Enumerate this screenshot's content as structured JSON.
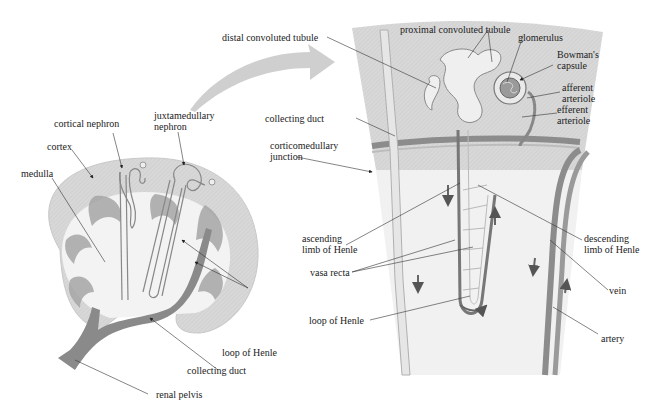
{
  "diagram": {
    "colors": {
      "cortex": "#d6d6d6",
      "medulla": "#f2f2f2",
      "medulla_stripes": "#9c9c9c",
      "collecting_duct": "#7a7a7a",
      "vessels": "#8c8c8c",
      "tubule": "#f4f4f4",
      "arrow": "#cfcfcf",
      "text": "#222222"
    },
    "left_panel": {
      "name": "kidney cross-section",
      "labels": {
        "cortex": "cortex",
        "medulla": "medulla",
        "cortical_nephron": "cortical nephron",
        "juxtamedullary_nephron_line1": "juxtamedullary",
        "juxtamedullary_nephron_line2": "nephron",
        "loop_of_henle": "loop of Henle",
        "collecting_duct": "collecting duct",
        "renal_pelvis": "renal pelvis"
      }
    },
    "right_panel": {
      "name": "enlarged juxtamedullary nephron",
      "labels": {
        "distal_convoluted_tubule": "distal convoluted tubule",
        "proximal_convoluted_tubule": "proximal convoluted tubule",
        "glomerulus": "glomerulus",
        "bowmans_capsule_line1": "Bowman's",
        "bowmans_capsule_line2": "capsule",
        "afferent_arteriole_line1": "afferent",
        "afferent_arteriole_line2": "arteriole",
        "efferent_arteriole_line1": "efferent",
        "efferent_arteriole_line2": "arteriole",
        "collecting_duct": "collecting duct",
        "corticomedullary_junction_line1": "corticomedullary",
        "corticomedullary_junction_line2": "junction",
        "ascending_limb_line1": "ascending",
        "ascending_limb_line2": "limb of Henle",
        "descending_limb_line1": "descending",
        "descending_limb_line2": "limb of Henle",
        "vasa_recta": "vasa recta",
        "loop_of_henle": "loop of Henle",
        "vein": "vein",
        "artery": "artery"
      }
    }
  }
}
